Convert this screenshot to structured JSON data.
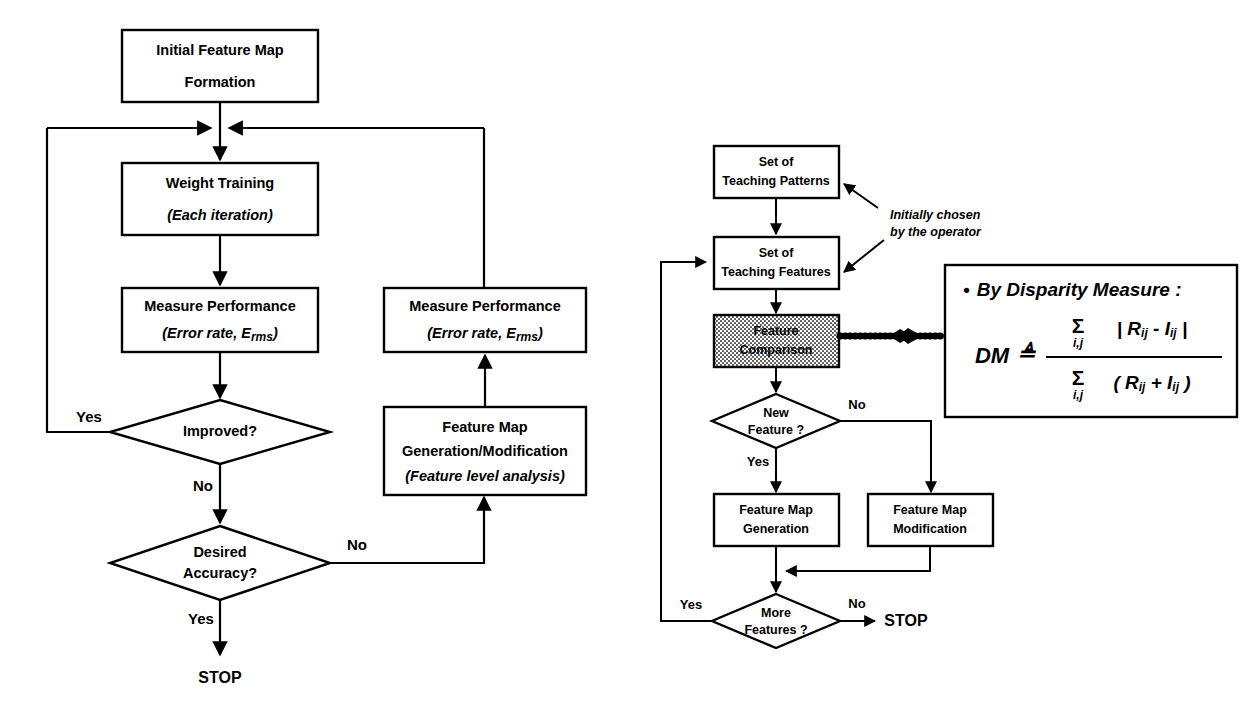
{
  "diagram": {
    "colors": {
      "stroke": "#000000",
      "background": "#ffffff",
      "shaded_fill": "#cccccc"
    }
  },
  "left_flowchart": {
    "nodes": {
      "initial_feature_map": {
        "line1": "Initial Feature Map",
        "line2": "Formation"
      },
      "weight_training": {
        "line1": "Weight Training",
        "line2": "(Each iteration)"
      },
      "measure_performance_left": {
        "line1": "Measure Performance",
        "line2_a": "(Error rate, E",
        "line2_sub": "rms",
        "line2_b": ")"
      },
      "improved": {
        "label": "Improved?"
      },
      "desired_accuracy": {
        "line1": "Desired",
        "line2": "Accuracy?"
      },
      "measure_performance_right": {
        "line1": "Measure Performance",
        "line2_a": "(Error rate, E",
        "line2_sub": "rms",
        "line2_b": ")"
      },
      "feature_map_genmod": {
        "line1": "Feature Map",
        "line2": "Generation/Modification",
        "line3": "(Feature level analysis)"
      },
      "stop": {
        "label": "STOP"
      }
    },
    "edge_labels": {
      "improved_yes": "Yes",
      "improved_no": "No",
      "accuracy_no": "No",
      "accuracy_yes": "Yes"
    }
  },
  "right_flowchart": {
    "nodes": {
      "teaching_patterns": {
        "line1": "Set of",
        "line2": "Teaching Patterns"
      },
      "teaching_features": {
        "line1": "Set of",
        "line2": "Teaching Features"
      },
      "feature_comparison": {
        "line1": "Feature",
        "line2": "Comparison",
        "shaded": true
      },
      "new_feature": {
        "line1": "New",
        "line2": "Feature ?"
      },
      "feature_map_generation": {
        "line1": "Feature Map",
        "line2": "Generation"
      },
      "feature_map_modification": {
        "line1": "Feature Map",
        "line2": "Modification"
      },
      "more_features": {
        "line1": "More",
        "line2": "Features ?"
      },
      "stop": {
        "label": "STOP"
      }
    },
    "annotation": {
      "line1": "Initially chosen",
      "line2": "by the operator"
    },
    "edge_labels": {
      "new_feature_no": "No",
      "new_feature_yes": "Yes",
      "more_features_yes": "Yes",
      "more_features_no": "No"
    }
  },
  "formula_box": {
    "heading_bullet": "•",
    "heading": "By Disparity Measure :",
    "lhs": "DM",
    "relation": "≜",
    "numerator": {
      "sigma": "Σ",
      "sigma_sub": "i,j",
      "expr": "| R",
      "expr_sub1": "ij",
      "expr_mid": " - I",
      "expr_sub2": "ij",
      "expr_end": " |"
    },
    "denominator": {
      "sigma": "Σ",
      "sigma_sub": "i,j",
      "expr": "( R",
      "expr_sub1": "ij",
      "expr_mid": " + I",
      "expr_sub2": "ij",
      "expr_end": " )"
    },
    "numerator_plain": "| R ij - I ij |",
    "denominator_plain": "( R ij + I ij )"
  }
}
